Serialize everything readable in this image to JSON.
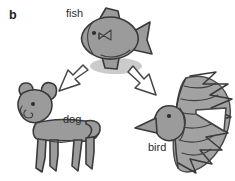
{
  "figure": {
    "panel_letter": "b",
    "background_color": "#ffffff",
    "ink_color": "#3a3a3a",
    "fill_color": "#9b9b9b",
    "label_color": "#2b2b2b",
    "width": 235,
    "height": 181
  },
  "nodes": [
    {
      "id": "fish",
      "label": "fish",
      "icon": "fish-sketch-icon",
      "label_x": 66,
      "label_y": 17
    },
    {
      "id": "dog",
      "label": "dog",
      "icon": "dog-sketch-icon",
      "label_x": 63,
      "label_y": 123
    },
    {
      "id": "bird",
      "label": "bird",
      "icon": "bird-sketch-icon",
      "label_x": 148,
      "label_y": 151
    }
  ],
  "arrows": [
    {
      "id": "fish-to-dog",
      "icon": "arrow-down-left-icon",
      "from": "fish",
      "to": "dog",
      "direction": "down-left"
    },
    {
      "id": "fish-to-bird",
      "icon": "arrow-down-right-icon",
      "from": "fish",
      "to": "bird",
      "direction": "down-right"
    }
  ]
}
